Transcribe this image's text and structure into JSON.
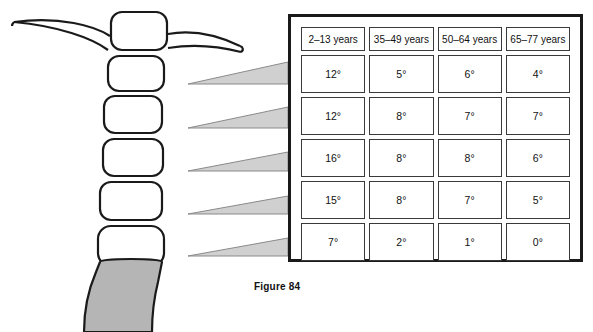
{
  "figure": {
    "caption": "Figure 84"
  },
  "table": {
    "headers": [
      "2–13 years",
      "35–49 years",
      "50–64 years",
      "65–77 years"
    ],
    "rows": [
      [
        "12°",
        "5°",
        "6°",
        "4°"
      ],
      [
        "12°",
        "8°",
        "7°",
        "7°"
      ],
      [
        "16°",
        "8°",
        "8°",
        "6°"
      ],
      [
        "15°",
        "8°",
        "7°",
        "5°"
      ],
      [
        "7°",
        "2°",
        "1°",
        "0°"
      ]
    ]
  },
  "diagram": {
    "name": "lumbar-spine-segments",
    "vertebra_count": 6,
    "wedge_count": 5,
    "colors": {
      "outline": "#1a1a1a",
      "vertebra_fill": "#ffffff",
      "wedge_fill": "#d0d0d0",
      "sacrum_fill": "#b5b5b5"
    }
  }
}
